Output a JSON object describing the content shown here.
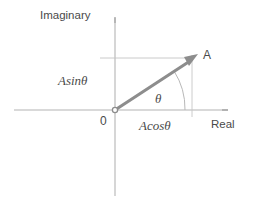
{
  "figure": {
    "type": "phasor-diagram",
    "background_color": "#ffffff",
    "axis_color": "#b0b0b0",
    "vector_color": "#8a8a8a",
    "text_color": "#4a4a4a",
    "labels": {
      "imaginary_axis": "Imaginary",
      "real_axis": "Real",
      "origin": "0",
      "point": "A",
      "angle": "θ",
      "vertical_component": "Asinθ",
      "horizontal_component": "Acosθ"
    },
    "geometry": {
      "origin": [
        115,
        110
      ],
      "vector_tip": [
        196,
        57
      ],
      "vertical_axis": {
        "x": 115,
        "y_top": 18,
        "y_bottom": 196
      },
      "horizontal_axis": {
        "y": 110,
        "x_left": 14,
        "x_right": 228
      },
      "projection_horizontal": {
        "y": 58,
        "x_start": 100,
        "x_end": 193
      },
      "projection_vertical": {
        "x": 192,
        "y_start": 56,
        "y_end": 116
      },
      "angle_arc_radius": 70,
      "angle_degrees": 33
    }
  }
}
